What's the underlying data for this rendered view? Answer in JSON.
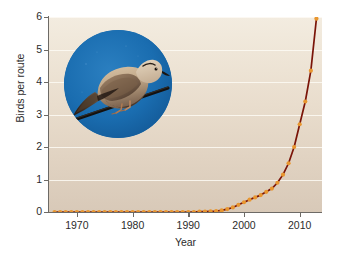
{
  "chart_data": {
    "type": "line",
    "title": "",
    "subtitle": "",
    "xlabel": "Year",
    "ylabel": "Birds per route",
    "xlim": [
      1965,
      2014
    ],
    "ylim": [
      0,
      6
    ],
    "xticks": [
      "1970",
      "1980",
      "1990",
      "2000",
      "2010"
    ],
    "xtick_values": [
      1970,
      1980,
      1990,
      2000,
      2010
    ],
    "yticks": [
      "0",
      "1",
      "2",
      "3",
      "4",
      "5",
      "6"
    ],
    "ytick_values": [
      0,
      1,
      2,
      3,
      4,
      5,
      6
    ],
    "grid": "horizontal",
    "legend": "none",
    "series": [
      {
        "name": "Eurasian Collared-Dove",
        "line_color": "#7a1408",
        "marker_color": "#e8962f",
        "marker": "circle",
        "x": [
          1966,
          1967,
          1968,
          1969,
          1970,
          1971,
          1972,
          1973,
          1974,
          1975,
          1976,
          1977,
          1978,
          1979,
          1980,
          1981,
          1982,
          1983,
          1984,
          1985,
          1986,
          1987,
          1988,
          1989,
          1990,
          1991,
          1992,
          1993,
          1994,
          1995,
          1996,
          1997,
          1998,
          1999,
          2000,
          2001,
          2002,
          2003,
          2004,
          2005,
          2006,
          2007,
          2008,
          2009,
          2010,
          2011,
          2012,
          2013
        ],
        "y": [
          0.0,
          0.0,
          0.0,
          0.0,
          0.0,
          0.0,
          0.0,
          0.0,
          0.0,
          0.0,
          0.0,
          0.0,
          0.0,
          0.0,
          0.0,
          0.0,
          0.0,
          0.0,
          0.0,
          0.0,
          0.0,
          0.0,
          0.0,
          0.0,
          0.0,
          0.0,
          0.01,
          0.01,
          0.02,
          0.03,
          0.05,
          0.09,
          0.14,
          0.22,
          0.3,
          0.38,
          0.45,
          0.52,
          0.62,
          0.72,
          0.9,
          1.15,
          1.5,
          2.0,
          2.7,
          3.4,
          4.35,
          5.95
        ]
      }
    ],
    "annotations": [
      {
        "name": "inset-photo",
        "description": "Circular inset photograph of a Eurasian Collared-Dove perched on a wire against a blue sky",
        "background_color": "#1668ab"
      }
    ],
    "colors": {
      "plot_background_top": "#f3ece0",
      "plot_background_bottom": "#d8c9b8",
      "gridline": "#fdfaf4",
      "axis": "#6d6a66",
      "line": "#7a1408",
      "marker": "#e8962f",
      "text": "#2b2b2b",
      "figure_background": "#ffffff"
    }
  }
}
